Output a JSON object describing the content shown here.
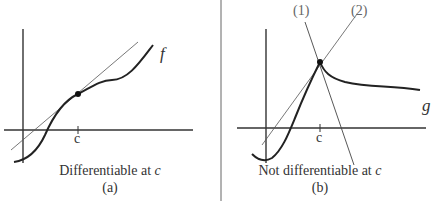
{
  "panel_a": {
    "function_label": "f",
    "tick_label": "c",
    "caption": "Differentiable at ",
    "caption_var": "c",
    "sublabel": "(a)"
  },
  "panel_b": {
    "function_label": "g",
    "tick_label": "c",
    "line1_label": "(1)",
    "line2_label": "(2)",
    "caption": "Not differentiable at ",
    "caption_var": "c",
    "sublabel": "(b)"
  },
  "colors": {
    "curve": "#222222",
    "line": "#555555",
    "text": "#333333"
  }
}
